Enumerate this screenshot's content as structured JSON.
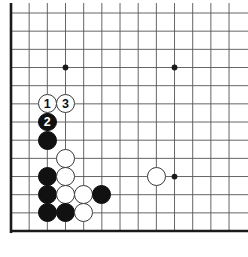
{
  "diagram": {
    "type": "go-board-problem-diagram",
    "board": {
      "cell": 18.17,
      "origin_x": 11,
      "origin_y": 13,
      "cols_visible": 13,
      "rows_visible": 13,
      "edges": {
        "left": "thick",
        "bottom": "thick",
        "top": "thin",
        "right": "cropped"
      },
      "line_color": "#555555",
      "edge_color": "#1a1a1a",
      "background": "#ffffff"
    },
    "star_points": [
      {
        "col": 3,
        "row": 3
      },
      {
        "col": 9,
        "row": 3
      },
      {
        "col": 9,
        "row": 9
      }
    ],
    "stones": [
      {
        "color": "white",
        "col": 2,
        "row": 5,
        "label": "1"
      },
      {
        "color": "white",
        "col": 3,
        "row": 5,
        "label": "3"
      },
      {
        "color": "black",
        "col": 2,
        "row": 6,
        "label": "2"
      },
      {
        "color": "black",
        "col": 2,
        "row": 7,
        "label": ""
      },
      {
        "color": "white",
        "col": 3,
        "row": 8,
        "label": ""
      },
      {
        "color": "black",
        "col": 2,
        "row": 9,
        "label": ""
      },
      {
        "color": "white",
        "col": 3,
        "row": 9,
        "label": ""
      },
      {
        "color": "black",
        "col": 2,
        "row": 10,
        "label": ""
      },
      {
        "color": "white",
        "col": 3,
        "row": 10,
        "label": ""
      },
      {
        "color": "white",
        "col": 4,
        "row": 10,
        "label": ""
      },
      {
        "color": "black",
        "col": 5,
        "row": 10,
        "label": ""
      },
      {
        "color": "black",
        "col": 2,
        "row": 11,
        "label": ""
      },
      {
        "color": "black",
        "col": 3,
        "row": 11,
        "label": ""
      },
      {
        "color": "white",
        "col": 4,
        "row": 11,
        "label": ""
      },
      {
        "color": "white",
        "col": 8,
        "row": 9,
        "label": ""
      }
    ],
    "move_numbers": [
      "1",
      "2",
      "3"
    ],
    "colors": {
      "black_stone": "#111111",
      "white_stone": "#ffffff",
      "white_stone_outline": "#3a3a3a",
      "grid": "#555555",
      "border": "#1a1a1a"
    }
  }
}
